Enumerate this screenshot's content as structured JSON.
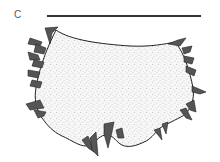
{
  "figure": {
    "panel_label": "C",
    "scale_bar": {
      "present": true,
      "color": "#333333"
    },
    "specimen": {
      "fill_style": "stippled",
      "outline_color": "#222222",
      "appendage_color": "#444444"
    }
  }
}
